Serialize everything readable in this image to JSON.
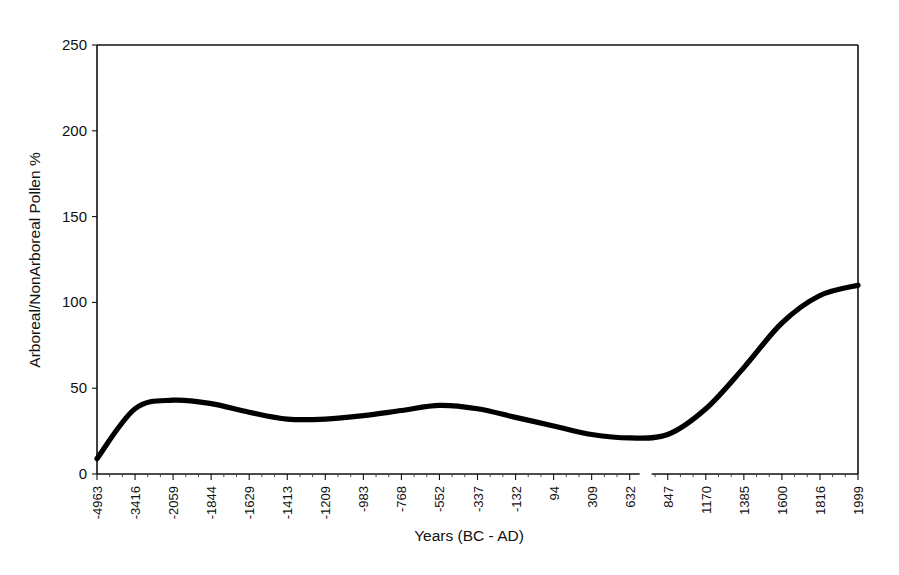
{
  "figure": {
    "background_color": "#ffffff",
    "line_color": "#000000",
    "axis_color": "#111111"
  },
  "chart_data": {
    "type": "line",
    "title": "",
    "xlabel": "Years (BC - AD)",
    "ylabel": "Arboreal/NonArboreal Pollen %",
    "ylim": [
      0,
      250
    ],
    "yticks": [
      0,
      50,
      100,
      150,
      200,
      250
    ],
    "ytick_labels": [
      "0",
      "50",
      "100",
      "150",
      "200",
      "250"
    ],
    "grid": false,
    "legend": "none",
    "axis_break_after_category": "632",
    "categories": [
      "-4963",
      "-3416",
      "-2059",
      "-1844",
      "-1629",
      "-1413",
      "-1209",
      "-983",
      "-768",
      "-552",
      "-337",
      "-132",
      "94",
      "309",
      "632",
      "847",
      "1170",
      "1385",
      "1600",
      "1816",
      "1999"
    ],
    "values": [
      9,
      38,
      43,
      41,
      36,
      32,
      32,
      34,
      37,
      40,
      38,
      33,
      28,
      23,
      21,
      23,
      38,
      62,
      88,
      104,
      110
    ],
    "series": [
      {
        "name": "Arboreal/NonArboreal Pollen %",
        "values": [
          9,
          38,
          43,
          41,
          36,
          32,
          32,
          34,
          37,
          40,
          38,
          33,
          28,
          23,
          21,
          23,
          38,
          62,
          88,
          104,
          110
        ]
      }
    ],
    "annotations": []
  },
  "caption": {
    "partial_text": ""
  }
}
